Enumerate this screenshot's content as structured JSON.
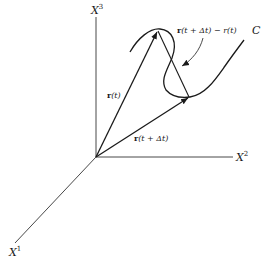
{
  "diagram": {
    "type": "vector-curve-3d",
    "axes": {
      "x1": {
        "label": "X",
        "superscript": "1"
      },
      "x2": {
        "label": "X",
        "superscript": "2"
      },
      "x3": {
        "label": "X",
        "superscript": "3"
      }
    },
    "vectors": {
      "r_t": {
        "bold": "r",
        "rest": "(t)"
      },
      "r_t_dt": {
        "bold": "r",
        "rest": "(t + Δt)"
      },
      "difference": {
        "bold": "r",
        "rest": "(t + Δt) − r(t)"
      }
    },
    "curve_label": "C",
    "colors": {
      "ink": "#1a1a1a",
      "background": "#ffffff"
    }
  }
}
